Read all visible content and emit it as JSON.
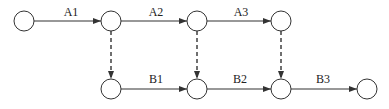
{
  "diagram": {
    "type": "network-diagram",
    "nodes": [
      {
        "id": "t1",
        "x": 24,
        "y": 21
      },
      {
        "id": "t2",
        "x": 111,
        "y": 21
      },
      {
        "id": "t3",
        "x": 197,
        "y": 21
      },
      {
        "id": "t4",
        "x": 281,
        "y": 21
      },
      {
        "id": "b1",
        "x": 111,
        "y": 89
      },
      {
        "id": "b2",
        "x": 197,
        "y": 89
      },
      {
        "id": "b3",
        "x": 281,
        "y": 89
      },
      {
        "id": "b4",
        "x": 367,
        "y": 89
      }
    ],
    "activities": [
      {
        "label": "A1",
        "from": "t1",
        "to": "t2",
        "style": "solid"
      },
      {
        "label": "A2",
        "from": "t2",
        "to": "t3",
        "style": "solid"
      },
      {
        "label": "A3",
        "from": "t3",
        "to": "t4",
        "style": "solid"
      },
      {
        "label": "B1",
        "from": "b1",
        "to": "b2",
        "style": "solid"
      },
      {
        "label": "B2",
        "from": "b2",
        "to": "b3",
        "style": "solid"
      },
      {
        "label": "B3",
        "from": "b3",
        "to": "b4",
        "style": "solid"
      }
    ],
    "dummies": [
      {
        "from": "t2",
        "to": "b1",
        "style": "dashed"
      },
      {
        "from": "t3",
        "to": "b2",
        "style": "dashed"
      },
      {
        "from": "t4",
        "to": "b3",
        "style": "dashed"
      }
    ],
    "labels": {
      "a1": "A1",
      "a2": "A2",
      "a3": "A3",
      "b1": "B1",
      "b2": "B2",
      "b3": "B3"
    }
  }
}
